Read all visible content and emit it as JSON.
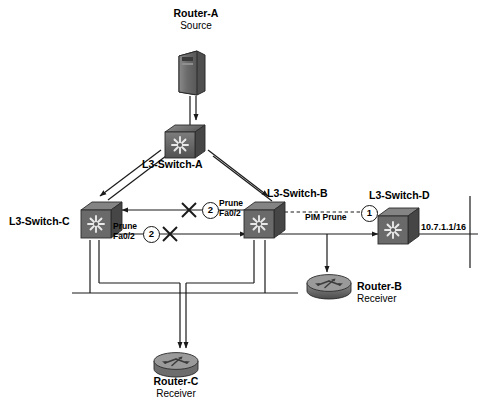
{
  "diagram": {
    "background": "#ffffff",
    "ink": "#1a1a1a",
    "device_fill": "#6e6e6e"
  },
  "nodes": [
    {
      "id": "router-a",
      "icon": "server-icon",
      "name": "Router-A",
      "role": "Source",
      "x": 175,
      "y": 48,
      "label_x": 196,
      "label_y": 8
    },
    {
      "id": "l3-switch-a",
      "icon": "switch-icon",
      "name": "L3-Switch-A",
      "role": "",
      "x": 163,
      "y": 124,
      "label_x": 183,
      "label_y": 161
    },
    {
      "id": "l3-switch-c",
      "icon": "switch-icon",
      "name": "L3-Switch-C",
      "role": "",
      "x": 79,
      "y": 203,
      "label_x": 42,
      "label_y": 218
    },
    {
      "id": "l3-switch-b",
      "icon": "switch-icon",
      "name": "L3-Switch-B",
      "role": "",
      "x": 242,
      "y": 203,
      "label_x": 307,
      "label_y": 192
    },
    {
      "id": "l3-switch-d",
      "icon": "switch-icon",
      "name": "L3-Switch-D",
      "role": "",
      "x": 379,
      "y": 209,
      "label_x": 405,
      "label_y": 194
    },
    {
      "id": "router-b",
      "icon": "router-icon",
      "name": "Router-B",
      "role": "Receiver",
      "x": 308,
      "y": 273,
      "label_x": 358,
      "label_y": 281
    },
    {
      "id": "router-c",
      "icon": "router-icon",
      "name": "Router-C",
      "role": "Receiver",
      "x": 152,
      "y": 352,
      "label_x": 192,
      "label_y": 377
    }
  ],
  "annotations": [
    {
      "id": "prune-upper",
      "line1": "Prune",
      "line2": "Fa0/2",
      "x": 219,
      "y": 200,
      "step": "2",
      "step_x": 203,
      "step_y": 203
    },
    {
      "id": "prune-lower",
      "line1": "Prune",
      "line2": "Fa0/2",
      "x": 113,
      "y": 223,
      "step": "2",
      "step_x": 144,
      "step_y": 227
    },
    {
      "id": "pim-prune",
      "line1": "PIM Prune",
      "line2": "",
      "x": 305,
      "y": 214,
      "step": "1",
      "step_x": 364,
      "step_y": 205
    }
  ],
  "network_labels": [
    {
      "id": "subnet-right",
      "text": "10.7.1.1/16",
      "x": 423,
      "y": 222
    }
  ],
  "markers": {
    "cross_label": "link-blocked-x",
    "crosses": [
      {
        "id": "cross-upper",
        "x": 189,
        "y": 210
      },
      {
        "id": "cross-lower",
        "x": 170,
        "y": 234
      }
    ]
  }
}
